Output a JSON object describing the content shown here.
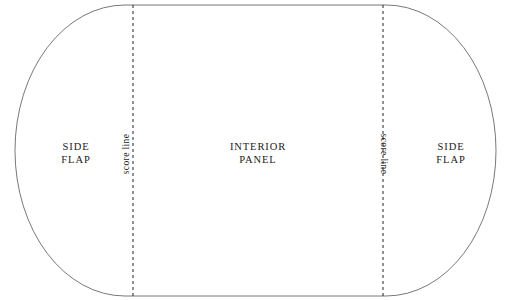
{
  "diagram": {
    "type": "die-line-template",
    "stroke_color": "#555555",
    "score_line_color": "#222222",
    "background_color": "#ffffff",
    "outline": {
      "shape": "stadium",
      "left_edge_x": 15,
      "right_edge_x": 496,
      "top_edge_y": 5,
      "bottom_edge_y": 296,
      "corner_radius": 110
    },
    "score_lines": [
      {
        "name": "left-score-line",
        "x": 133,
        "style": "dashed",
        "label": "score line",
        "rotation_deg": -90
      },
      {
        "name": "right-score-line",
        "x": 383,
        "style": "dashed",
        "label": "score line",
        "rotation_deg": 90
      }
    ],
    "regions": [
      {
        "name": "left-side-flap",
        "label_line_1": "SIDE",
        "label_line_2": "FLAP"
      },
      {
        "name": "interior-panel",
        "label_line_1": "INTERIOR",
        "label_line_2": "PANEL"
      },
      {
        "name": "right-side-flap",
        "label_line_1": "SIDE",
        "label_line_2": "FLAP"
      }
    ]
  }
}
